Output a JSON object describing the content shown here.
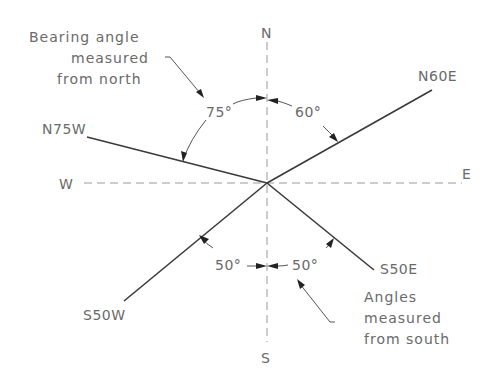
{
  "diagram": {
    "compass": {
      "north": "N",
      "south": "S",
      "east": "E",
      "west": "W"
    },
    "bearings": [
      {
        "label": "N60E",
        "angle": "60°"
      },
      {
        "label": "N75W",
        "angle": "75°"
      },
      {
        "label": "S50E",
        "angle": "50°"
      },
      {
        "label": "S50W",
        "angle": "50°"
      }
    ],
    "notes": {
      "north_note": [
        "Bearing angle",
        "measured",
        "from north"
      ],
      "south_note": [
        "Angles",
        "measured",
        "from south"
      ]
    },
    "colors": {
      "text": "#6a6a6a",
      "line": "#3a3a3a",
      "axis": "#9a9a9a",
      "background": "#ffffff"
    }
  }
}
